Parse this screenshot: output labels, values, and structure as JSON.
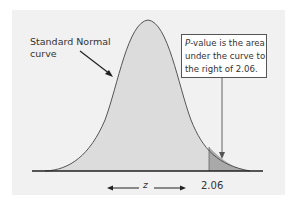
{
  "diagram": {
    "curve_label_line1": "Standard Normal",
    "curve_label_line2": "curve",
    "callout": {
      "p_italic": "P",
      "line1_rest": "-value is the area",
      "line2": "under the curve to",
      "line3": "the right of  2.06."
    },
    "axis_variable": "z",
    "critical_value_label": "2.06",
    "critical_value": 2.06,
    "colors": {
      "panel_background": "#f1f1f1",
      "curve_fill": "#dcdcdc",
      "tail_fill": "#a9a9a9",
      "curve_stroke": "#555555",
      "baseline": "#222222"
    }
  }
}
